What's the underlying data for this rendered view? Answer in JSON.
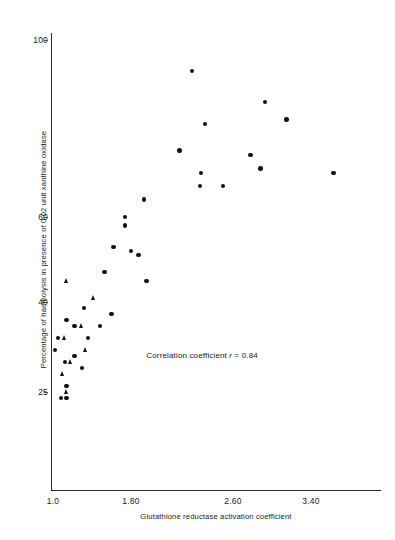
{
  "chart_data": {
    "type": "scatter",
    "title": "",
    "xlabel": "Glutathione reductase activation coefficient",
    "ylabel": "Percentage of haemolysis in presence of 0.02 unit xanthine oxidase",
    "xticks": [
      "1.0",
      "1.80",
      "2.60",
      "3.40"
    ],
    "xtick_values": [
      1.0,
      1.8,
      2.6,
      3.4
    ],
    "yticks": [
      "100",
      "60",
      "40",
      "25"
    ],
    "ytick_values": [
      100,
      60,
      40,
      25
    ],
    "xlim": [
      1.0,
      3.7
    ],
    "ylim": [
      20,
      105
    ],
    "grid": false,
    "legend": "none",
    "annotations": [
      {
        "text_prefix": "Correlation coefficient ",
        "text_italic": "r",
        "text_suffix": " = 0.84",
        "x": 1.92,
        "y": 31
      }
    ],
    "marker_shapes": [
      "circle",
      "square",
      "triangle"
    ],
    "marker_color": "#111111",
    "series": [
      {
        "name": "circle",
        "marker": "circle",
        "points": [
          {
            "x": 2.28,
            "y": 93
          },
          {
            "x": 2.93,
            "y": 86
          },
          {
            "x": 3.15,
            "y": 82
          },
          {
            "x": 2.38,
            "y": 81
          },
          {
            "x": 2.18,
            "y": 75
          },
          {
            "x": 2.78,
            "y": 74
          },
          {
            "x": 2.88,
            "y": 71
          },
          {
            "x": 3.63,
            "y": 70
          },
          {
            "x": 2.35,
            "y": 70
          },
          {
            "x": 2.34,
            "y": 67
          },
          {
            "x": 2.52,
            "y": 67
          },
          {
            "x": 1.9,
            "y": 64
          },
          {
            "x": 1.74,
            "y": 60
          },
          {
            "x": 1.74,
            "y": 58
          },
          {
            "x": 1.62,
            "y": 53
          },
          {
            "x": 1.8,
            "y": 52
          },
          {
            "x": 1.86,
            "y": 51
          },
          {
            "x": 1.53,
            "y": 47
          },
          {
            "x": 1.92,
            "y": 45
          },
          {
            "x": 1.32,
            "y": 39
          },
          {
            "x": 1.6,
            "y": 38
          },
          {
            "x": 1.14,
            "y": 37
          },
          {
            "x": 1.22,
            "y": 36
          },
          {
            "x": 1.48,
            "y": 36
          },
          {
            "x": 1.05,
            "y": 34
          },
          {
            "x": 1.36,
            "y": 34
          },
          {
            "x": 1.02,
            "y": 32
          },
          {
            "x": 1.22,
            "y": 31
          },
          {
            "x": 1.12,
            "y": 30
          },
          {
            "x": 1.14,
            "y": 26
          },
          {
            "x": 1.14,
            "y": 24
          },
          {
            "x": 1.08,
            "y": 24
          },
          {
            "x": 1.3,
            "y": 29
          }
        ]
      },
      {
        "name": "triangle",
        "marker": "triangle",
        "points": [
          {
            "x": 1.14,
            "y": 45
          },
          {
            "x": 1.42,
            "y": 41
          },
          {
            "x": 1.3,
            "y": 36
          },
          {
            "x": 1.12,
            "y": 34
          },
          {
            "x": 1.34,
            "y": 32
          },
          {
            "x": 1.18,
            "y": 30
          },
          {
            "x": 1.1,
            "y": 28
          },
          {
            "x": 1.14,
            "y": 25
          }
        ]
      }
    ]
  },
  "figure": {
    "background": "#ffffff",
    "foreground": "#1a1a1a"
  }
}
